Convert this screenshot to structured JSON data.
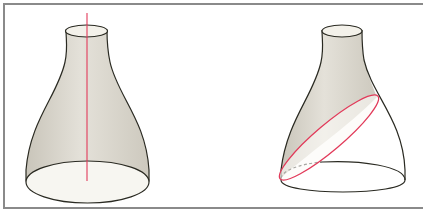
{
  "figure": {
    "colors": {
      "outline": "#2a2a22",
      "surface_fill": "#dedbd2",
      "inner_fill": "#f7f6f1",
      "highlight": "#e23a5a",
      "frame": "#8a8a8a"
    },
    "panels": [
      {
        "name": "left",
        "feature": "axis-of-rotation"
      },
      {
        "name": "right",
        "feature": "oblique-section"
      }
    ]
  }
}
